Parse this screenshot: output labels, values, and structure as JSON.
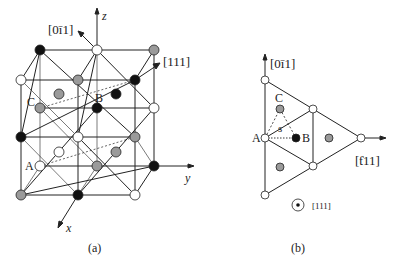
{
  "panel_a": {
    "caption": "(a)",
    "axes": {
      "z": "z",
      "y": "y",
      "x": "x"
    },
    "directions": {
      "top": "[0ī1]",
      "body": "[111]"
    },
    "labels": {
      "A": "A",
      "B": "B",
      "C": "C"
    }
  },
  "panel_b": {
    "caption": "(b)",
    "directions": {
      "up": "[0ī1]",
      "right": "[ƭ11]",
      "out_of_page": "[111]"
    },
    "labels": {
      "A": "A",
      "B": "B",
      "C": "C",
      "s": "s"
    }
  },
  "colors": {
    "white_atom": "#ffffff",
    "gray_atom": "#9a9a9a",
    "black_atom": "#111111",
    "line": "#222222"
  }
}
